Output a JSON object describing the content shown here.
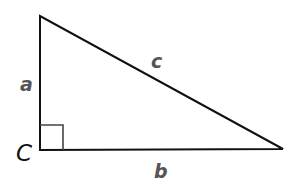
{
  "diagram": {
    "type": "right-triangle",
    "colors": {
      "stroke": "#111111",
      "side_label": "#555555",
      "vertex_label": "#111111",
      "right_angle_marker": "#444444"
    },
    "vertices": {
      "top": [
        40,
        16
      ],
      "right_angle": [
        40,
        150
      ],
      "right": [
        283,
        149
      ]
    },
    "labels": {
      "side_a": "a",
      "side_b": "b",
      "side_c": "c",
      "vertex_C": "C"
    }
  }
}
